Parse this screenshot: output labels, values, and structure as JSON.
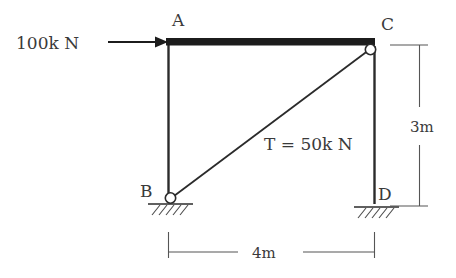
{
  "figure": {
    "type": "structural-free-body-diagram",
    "title": "",
    "colors": {
      "member_stroke": "#2b2b2b",
      "beam_fill": "#1c1c1c",
      "text": "#3a3a3a",
      "dimension_stroke": "#555555",
      "background": "#ffffff"
    },
    "nodes": [
      {
        "id": "A",
        "label": "A",
        "x": 168,
        "y": 43,
        "joint": "rigid"
      },
      {
        "id": "C",
        "label": "C",
        "x": 374,
        "y": 46,
        "joint": "pin"
      },
      {
        "id": "B",
        "label": "B",
        "x": 168,
        "y": 200,
        "joint": "pin-support"
      },
      {
        "id": "D",
        "label": "D",
        "x": 374,
        "y": 203,
        "joint": "fixed-support"
      }
    ],
    "members": [
      {
        "name": "top-beam",
        "from": "A",
        "to": "C",
        "style": "thick"
      },
      {
        "name": "left-column",
        "from": "A",
        "to": "B",
        "style": "thin"
      },
      {
        "name": "right-column",
        "from": "C",
        "to": "D",
        "style": "thin"
      },
      {
        "name": "diagonal-tie",
        "from": "B",
        "to": "C",
        "style": "thin"
      }
    ],
    "loads": [
      {
        "name": "applied-horizontal-load",
        "label": "100k N",
        "magnitude": 100,
        "unit": "kN",
        "direction": "right",
        "applied_at": "A"
      }
    ],
    "member_forces": [
      {
        "name": "tie-tension",
        "label": "T = 50k N",
        "symbol": "T",
        "magnitude": 50,
        "unit": "kN",
        "member": "diagonal-tie"
      }
    ],
    "dimensions": [
      {
        "name": "height-dimension",
        "label": "3m",
        "value": 3,
        "unit": "m",
        "orientation": "vertical",
        "measures": "C-to-D"
      },
      {
        "name": "span-dimension",
        "label": "4m",
        "value": 4,
        "unit": "m",
        "orientation": "horizontal",
        "measures": "B-to-D"
      }
    ],
    "supports": [
      {
        "name": "support-b",
        "at": "B",
        "kind": "hatched-ground"
      },
      {
        "name": "support-d",
        "at": "D",
        "kind": "hatched-ground"
      }
    ]
  }
}
